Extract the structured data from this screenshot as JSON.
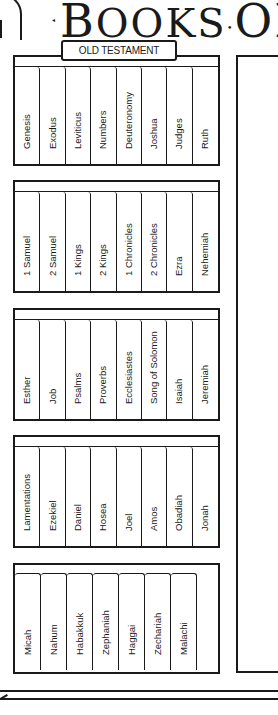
{
  "header": {
    "title_first": "B",
    "title_rest": "OOKS",
    "title_sep": "•",
    "title_second": "OF",
    "title_trail": "•",
    "section_label": "OLD TESTAMENT"
  },
  "shelves": [
    {
      "books": [
        "Genesis",
        "Exodus",
        "Leviticus",
        "Numbers",
        "Deuteronomy",
        "Joshua",
        "Judges",
        "Ruth"
      ]
    },
    {
      "books": [
        "1 Samuel",
        "2 Samuel",
        "1 Kings",
        "2 Kings",
        "1 Chronicles",
        "2 Chronicles",
        "Ezra",
        "Nehemiah"
      ]
    },
    {
      "books": [
        "Esther",
        "Job",
        "Psalms",
        "Proverbs",
        "Ecclesiastes",
        "Song of Solomon",
        "Isaiah",
        "Jeremiah"
      ]
    },
    {
      "books": [
        "Lamentations",
        "Ezekiel",
        "Daniel",
        "Hosea",
        "Joel",
        "Amos",
        "Obadiah",
        "Jonah"
      ]
    },
    {
      "books": [
        "Micah",
        "Nahum",
        "Habakkuk",
        "Zephaniah",
        "Haggai",
        "Zechariah",
        "Malachi"
      ]
    }
  ],
  "colors": {
    "ink": "#1a1a1a",
    "paper": "#ffffff"
  }
}
